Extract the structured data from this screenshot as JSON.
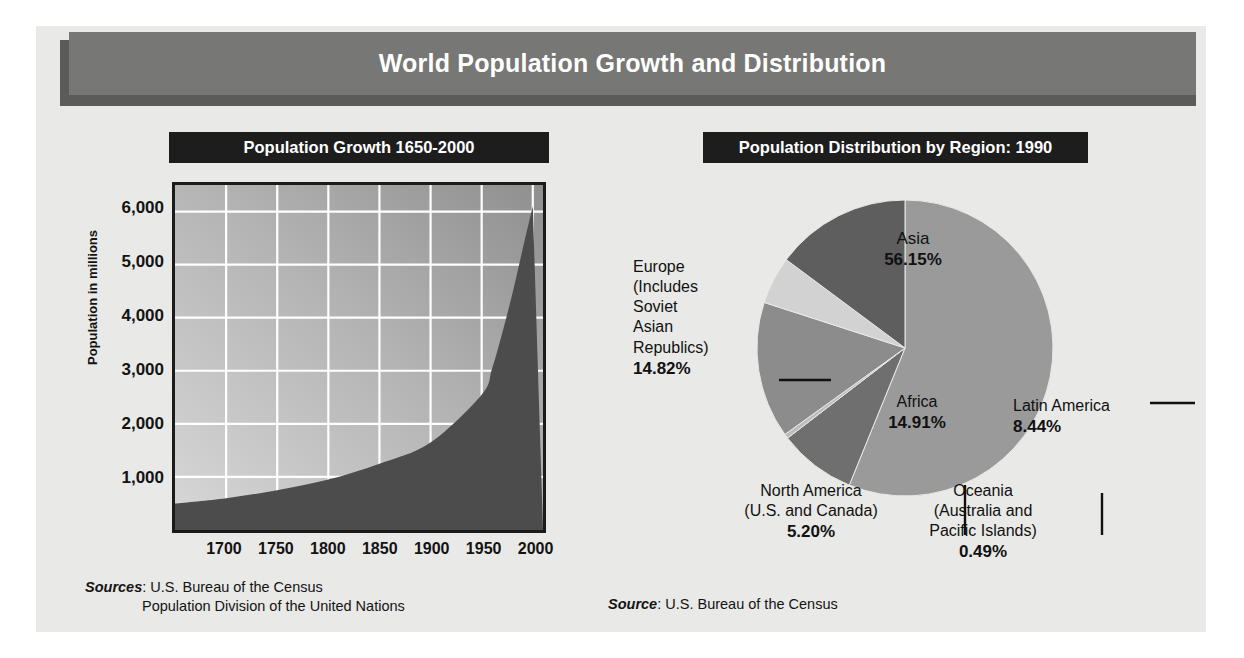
{
  "title": "World Population Growth and Distribution",
  "left_panel": {
    "header": "Population Growth 1650-2000",
    "sources_label": "Sources",
    "source_line_1": ": U.S. Bureau of the Census",
    "source_line_2": "Population Division of the United Nations"
  },
  "right_panel": {
    "header": "Population Distribution by Region: 1990",
    "source_label": "Source",
    "source_text": ": U.S. Bureau of the Census"
  },
  "colors": {
    "page_panel": "#e9e9e7",
    "title_bar": "#777775",
    "title_shadow": "#5b5b5b",
    "header_bar": "#1d1d1d",
    "area_fill": "#4c4c4c",
    "plot_border": "#1b1b1b",
    "gridline": "#ffffff",
    "asia": "#9a9a9a",
    "europe": "#5e5e5e",
    "africa": "#8c8c8c",
    "latin_america": "#6f6f6f",
    "north_america": "#d2d2d2",
    "oceania": "#bdbdbd"
  },
  "chart_data": [
    {
      "type": "area",
      "title": "Population Growth 1650-2000",
      "xlabel": "",
      "ylabel": "Population in millions",
      "xlim": [
        1650,
        2010
      ],
      "ylim": [
        0,
        6500
      ],
      "grid": true,
      "legend": "none",
      "xticks": [
        "1700",
        "1750",
        "1800",
        "1850",
        "1900",
        "1950",
        "2000"
      ],
      "xtick_values": [
        1700,
        1750,
        1800,
        1850,
        1900,
        1950,
        2000
      ],
      "yticks": [
        "1,000",
        "2,000",
        "3,000",
        "4,000",
        "5,000",
        "6,000"
      ],
      "ytick_values": [
        1000,
        2000,
        3000,
        4000,
        5000,
        6000
      ],
      "x": [
        1650,
        1700,
        1750,
        1800,
        1850,
        1900,
        1950,
        1960,
        1970,
        1980,
        1990,
        2000
      ],
      "values": [
        500,
        600,
        750,
        950,
        1250,
        1650,
        2550,
        3030,
        3700,
        4450,
        5280,
        6100
      ]
    },
    {
      "type": "pie",
      "title": "Population Distribution by Region: 1990",
      "unit": "%",
      "labels": [
        "Asia",
        "Latin America",
        "Oceania (Australia and Pacific Islands)",
        "Africa",
        "North America (U.S. and Canada)",
        "Europe (Includes Soviet Asian Republics)"
      ],
      "values": [
        56.15,
        8.44,
        0.49,
        14.91,
        5.2,
        14.82
      ],
      "slices": [
        {
          "name": "Asia",
          "label_name": "Asia",
          "value": 56.15,
          "value_text": "56.15%",
          "color": "#9a9a9a"
        },
        {
          "name": "Latin America",
          "label_name": "Latin America",
          "value": 8.44,
          "value_text": "8.44%",
          "color": "#6f6f6f"
        },
        {
          "name": "Oceania",
          "label_name": "Oceania",
          "label_sub": "(Australia and Pacific Islands)",
          "value": 0.49,
          "value_text": "0.49%",
          "color": "#bdbdbd"
        },
        {
          "name": "Africa",
          "label_name": "Africa",
          "value": 14.91,
          "value_text": "14.91%",
          "color": "#8c8c8c"
        },
        {
          "name": "North America",
          "label_name": "North America",
          "label_sub": "(U.S. and Canada)",
          "value": 5.2,
          "value_text": "5.20%",
          "color": "#d2d2d2"
        },
        {
          "name": "Europe",
          "label_name": "Europe",
          "label_sub": "(Includes Soviet Asian Republics)",
          "value": 14.82,
          "value_text": "14.82%",
          "color": "#5e5e5e"
        }
      ]
    }
  ],
  "pie_labels": {
    "asia_name": "Asia",
    "asia_value": "56.15%",
    "europe_l1": "Europe",
    "europe_l2": "(Includes",
    "europe_l3": "Soviet",
    "europe_l4": "Asian",
    "europe_l5": "Republics)",
    "europe_value": "14.82%",
    "latin_name": "Latin America",
    "latin_value": "8.44%",
    "africa_name": "Africa",
    "africa_value": "14.91%",
    "na_l1": "North America",
    "na_l2": "(U.S. and Canada)",
    "na_value": "5.20%",
    "oceania_l1": "Oceania",
    "oceania_l2": "(Australia and",
    "oceania_l3": "Pacific Islands)",
    "oceania_value": "0.49%"
  },
  "axis": {
    "y_title": "Population in millions"
  }
}
